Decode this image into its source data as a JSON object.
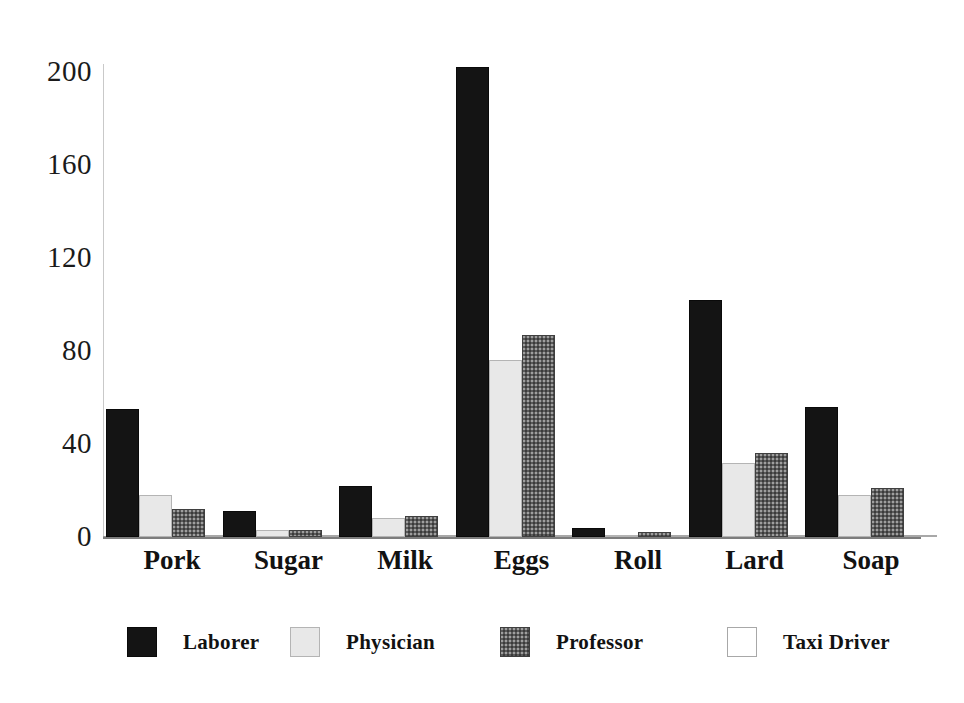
{
  "chart_data": {
    "type": "bar",
    "title": "",
    "subtitle": "",
    "xlabel": "",
    "ylabel": "",
    "categories": [
      "Pork",
      "Sugar",
      "Milk",
      "Eggs",
      "Roll",
      "Lard",
      "Soap"
    ],
    "series": [
      {
        "name": "Laborer",
        "color": "#141414",
        "values": [
          55,
          11,
          22,
          202,
          4,
          102,
          56
        ]
      },
      {
        "name": "Physician",
        "color": "#e8e8e8",
        "values": [
          18,
          3,
          8,
          76,
          1,
          32,
          18
        ]
      },
      {
        "name": "Professor",
        "color": "#5a5a5a",
        "values": [
          12,
          3,
          9,
          87,
          2,
          36,
          21
        ]
      },
      {
        "name": "Taxi Driver",
        "color": "#ffffff",
        "values": [
          0,
          0,
          0,
          0,
          0,
          0,
          0
        ]
      }
    ],
    "ylim": [
      0,
      200
    ],
    "yticks": [
      0,
      40,
      80,
      120,
      160,
      200
    ],
    "ytick_labels": [
      "0",
      "40",
      "80",
      "120",
      "160",
      "200"
    ],
    "grid": false,
    "legend_position": "bottom",
    "legend_entries": [
      "Laborer",
      "Physician",
      "Professor",
      "Taxi Driver"
    ]
  },
  "legend": {
    "items": [
      {
        "label": "Laborer",
        "swatch": "legend-swatch-laborer"
      },
      {
        "label": "Physician",
        "swatch": "legend-swatch-physician"
      },
      {
        "label": "Professor",
        "swatch": "legend-swatch-professor"
      },
      {
        "label": "Taxi Driver",
        "swatch": "legend-swatch-taxi-driver"
      }
    ]
  }
}
